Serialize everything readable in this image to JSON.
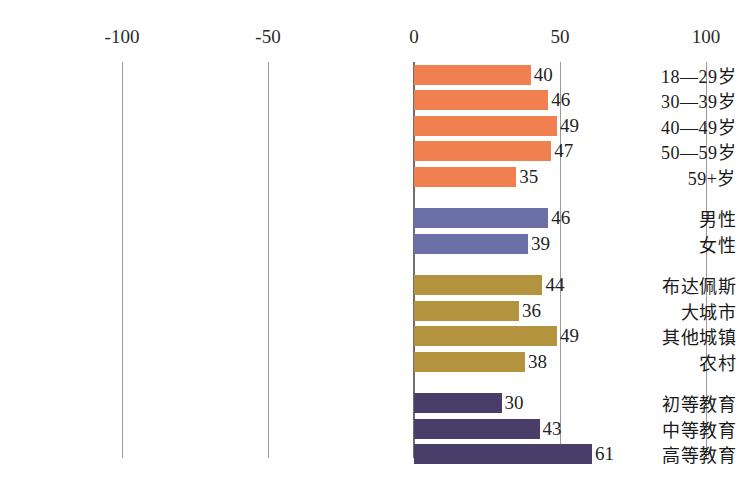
{
  "chart_data": {
    "type": "bar",
    "orientation": "horizontal",
    "title": "",
    "subtitle": "",
    "xlabel": "",
    "ylabel": "",
    "xlim": [
      -100,
      100
    ],
    "xticks": [
      -100,
      -50,
      0,
      50,
      100
    ],
    "xtick_labels": [
      "-100",
      "-50",
      "0",
      "50",
      "100"
    ],
    "grid": true,
    "legend": "none",
    "groups": [
      {
        "name": "age",
        "color": "#F0804F",
        "items": [
          {
            "label": "18—29岁",
            "value": 40
          },
          {
            "label": "30—39岁",
            "value": 46
          },
          {
            "label": "40—49岁",
            "value": 49
          },
          {
            "label": "50—59岁",
            "value": 47
          },
          {
            "label": "59+岁",
            "value": 35
          }
        ]
      },
      {
        "name": "gender",
        "color": "#6A6FA6",
        "items": [
          {
            "label": "男性",
            "value": 46
          },
          {
            "label": "女性",
            "value": 39
          }
        ]
      },
      {
        "name": "settlement",
        "color": "#B3933D",
        "items": [
          {
            "label": "布达佩斯",
            "value": 44
          },
          {
            "label": "大城市",
            "value": 36
          },
          {
            "label": "其他城镇",
            "value": 49
          },
          {
            "label": "农村",
            "value": 38
          }
        ]
      },
      {
        "name": "education",
        "color": "#483E69",
        "items": [
          {
            "label": "初等教育",
            "value": 30
          },
          {
            "label": "中等教育",
            "value": 43
          },
          {
            "label": "高等教育",
            "value": 61
          }
        ]
      }
    ],
    "categories": [
      "18—29岁",
      "30—39岁",
      "40—49岁",
      "50—59岁",
      "59+岁",
      "男性",
      "女性",
      "布达佩斯",
      "大城市",
      "其他城镇",
      "农村",
      "初等教育",
      "中等教育",
      "高等教育"
    ],
    "values": [
      40,
      46,
      49,
      47,
      35,
      46,
      39,
      44,
      36,
      49,
      38,
      30,
      43,
      61
    ]
  },
  "colors": {
    "age": "#F0804F",
    "gender": "#6A6FA6",
    "settlement": "#B3933D",
    "education": "#483E69",
    "gridline": "#9a9a9a",
    "axis": "#6e6e6e",
    "text": "#1a1a1a",
    "background": "#ffffff"
  }
}
